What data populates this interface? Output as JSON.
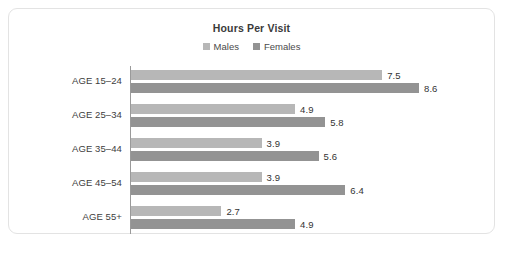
{
  "chart_data": {
    "type": "bar",
    "orientation": "horizontal",
    "title": "Hours Per Visit",
    "xlabel": "",
    "ylabel": "",
    "grid": false,
    "legend_position": "top-center",
    "xlim": [
      0,
      8.6
    ],
    "categories": [
      "AGE 15–24",
      "AGE 25–34",
      "AGE 35–44",
      "AGE 45–54",
      "AGE 55+"
    ],
    "series": [
      {
        "name": "Males",
        "color": "#b7b7b7",
        "values": [
          7.5,
          4.9,
          3.9,
          3.9,
          2.7
        ],
        "value_labels": [
          "7.5",
          "4.9",
          "3.9",
          "3.9",
          "2.7"
        ]
      },
      {
        "name": "Females",
        "color": "#939393",
        "values": [
          8.6,
          5.8,
          5.6,
          6.4,
          4.9
        ],
        "value_labels": [
          "8.6",
          "5.8",
          "5.6",
          "6.4",
          "4.9"
        ]
      }
    ]
  },
  "card": {
    "border_color": "#e3e3e3",
    "background": "#ffffff"
  },
  "legend": {
    "items": [
      {
        "label": "Males",
        "color": "#b7b7b7"
      },
      {
        "label": "Females",
        "color": "#939393"
      }
    ]
  }
}
